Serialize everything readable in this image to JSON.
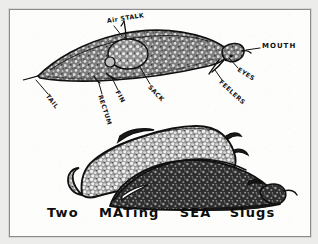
{
  "artwork": {
    "medium": "pen-and-ink drawing on white paper",
    "frame_color": "#8b8b8b",
    "paper_color": "#fdfdfc",
    "ink_color": "#101010",
    "backdrop_color": "#e9e9e9"
  },
  "caption": {
    "line": "Two MATing SEA Slugs",
    "word_1": "Two",
    "word_2": "MATing",
    "word_3": "SEA",
    "word_4": "Slugs"
  },
  "figures": {
    "top": {
      "name": "anatomical side view of a single sea slug",
      "fill_tone": "#6e6e6e"
    },
    "bottom": {
      "name": "two sea slugs mating, one mounted over the other",
      "upper_slug_tone": "#8a8a8a",
      "lower_slug_tone": "#3a3a3a"
    }
  },
  "labels": [
    {
      "id": "air-stalk",
      "text": "Air STALK"
    },
    {
      "id": "mouth",
      "text": "MOUTH"
    },
    {
      "id": "eyes",
      "text": "EYES"
    },
    {
      "id": "feelers",
      "text": "FEELERS"
    },
    {
      "id": "sack",
      "text": "SACK"
    },
    {
      "id": "fin",
      "text": "FIN"
    },
    {
      "id": "rectum",
      "text": "RECTUM"
    },
    {
      "id": "tail",
      "text": "TAIL"
    }
  ]
}
